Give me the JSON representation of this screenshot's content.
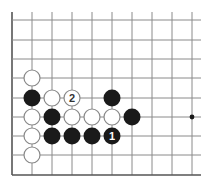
{
  "diagram": {
    "type": "go-board-fragment",
    "edges": [
      "left",
      "bottom"
    ],
    "columns_x": [
      12,
      32,
      52,
      72,
      92,
      112,
      132,
      152,
      172,
      192
    ],
    "rows_y": [
      20,
      40,
      59,
      78,
      98,
      117,
      136,
      155,
      175
    ],
    "line_top": 12,
    "line_right": 201,
    "line_color": "#8a8a8a",
    "edge_color": "#555555",
    "stone_radius": 8.5,
    "colors": {
      "black_stone": "#1a1a1a",
      "white_stone": "#ffffff",
      "white_stroke": "#888888",
      "hoshi": "#1a1a1a"
    },
    "hoshi": [
      {
        "col": 9,
        "row": 5
      }
    ],
    "stones": [
      {
        "col": 1,
        "row": 3,
        "color": "white",
        "label": ""
      },
      {
        "col": 1,
        "row": 4,
        "color": "black",
        "label": ""
      },
      {
        "col": 2,
        "row": 4,
        "color": "white",
        "label": ""
      },
      {
        "col": 3,
        "row": 4,
        "color": "white",
        "label": "2"
      },
      {
        "col": 5,
        "row": 4,
        "color": "black",
        "label": ""
      },
      {
        "col": 1,
        "row": 5,
        "color": "white",
        "label": ""
      },
      {
        "col": 2,
        "row": 5,
        "color": "black",
        "label": ""
      },
      {
        "col": 3,
        "row": 5,
        "color": "white",
        "label": ""
      },
      {
        "col": 4,
        "row": 5,
        "color": "white",
        "label": ""
      },
      {
        "col": 5,
        "row": 5,
        "color": "white",
        "label": ""
      },
      {
        "col": 6,
        "row": 5,
        "color": "black",
        "label": ""
      },
      {
        "col": 1,
        "row": 6,
        "color": "white",
        "label": ""
      },
      {
        "col": 2,
        "row": 6,
        "color": "black",
        "label": ""
      },
      {
        "col": 3,
        "row": 6,
        "color": "black",
        "label": ""
      },
      {
        "col": 4,
        "row": 6,
        "color": "black",
        "label": ""
      },
      {
        "col": 5,
        "row": 6,
        "color": "black",
        "label": "1"
      },
      {
        "col": 1,
        "row": 7,
        "color": "white",
        "label": ""
      }
    ]
  }
}
